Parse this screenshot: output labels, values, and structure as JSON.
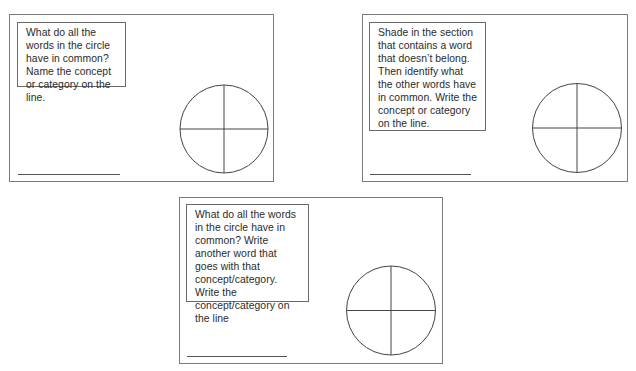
{
  "page": {
    "background": "#ffffff",
    "border_color": "#7a7a7a"
  },
  "cards": [
    {
      "id": "card-1",
      "prompt": "What do all the words in the circle have in common? Name the concept or category on the line.",
      "answer_line": "",
      "circle_sections": [
        "",
        "",
        "",
        ""
      ]
    },
    {
      "id": "card-2",
      "prompt": "Shade in the section that contains a word that doesn’t belong. Then identify what the other words have in common. Write the concept or category on the line.",
      "answer_line": "",
      "circle_sections": [
        "",
        "",
        "",
        ""
      ]
    },
    {
      "id": "card-3",
      "prompt": "What do all the words in the circle have in common? Write another word that goes with that concept/category. Write the concept/category on the line",
      "answer_line": "",
      "circle_sections": [
        "",
        "",
        "",
        ""
      ]
    }
  ]
}
